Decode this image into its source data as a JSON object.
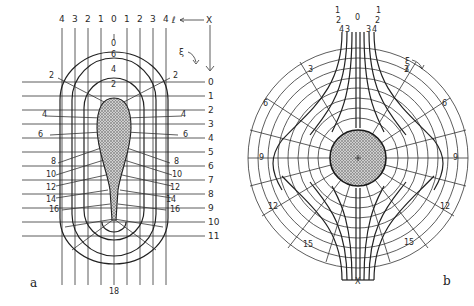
{
  "figure": {
    "panel_a": {
      "label": "a",
      "top_column_labels": [
        "4",
        "3",
        "2",
        "1",
        "0",
        "1",
        "2",
        "3",
        "4"
      ],
      "zeta_symbol": "ℓ",
      "x_marker": "X",
      "xi_symbol": "ξ",
      "center_top_label": "0",
      "row_labels": [
        "0",
        "1",
        "2",
        "3",
        "4",
        "5",
        "6",
        "7",
        "8",
        "9",
        "10",
        "11"
      ],
      "contour_labels_top": [
        "6",
        "4",
        "2"
      ],
      "side_labels_left": [
        "2",
        "4",
        "6",
        "8",
        "10",
        "12",
        "14",
        "16"
      ],
      "side_labels_right": [
        "2",
        "4",
        "6",
        "8",
        "10",
        "12",
        "14",
        "16"
      ],
      "bottom_label": "18"
    },
    "panel_b": {
      "label": "b",
      "top_labels_row1": [
        "1",
        "0",
        "1"
      ],
      "top_labels_row2": [
        "2",
        "2"
      ],
      "top_labels_row3": [
        "4",
        "3",
        "3",
        "4"
      ],
      "xi_symbol": "ξ",
      "zeta_symbol": "ℓ",
      "ring_labels": {
        "upper_left": "3",
        "upper_right": "3",
        "left_6": "6",
        "right_6": "6",
        "left_9": "9",
        "right_9": "9",
        "left_12": "12",
        "right_12": "12",
        "lower_left_15": "15",
        "lower_right_15": "15"
      },
      "bottom_marker": "X"
    },
    "colors": {
      "ink": "#222222",
      "hatch": "#8a8a8a",
      "background": "#ffffff"
    }
  }
}
